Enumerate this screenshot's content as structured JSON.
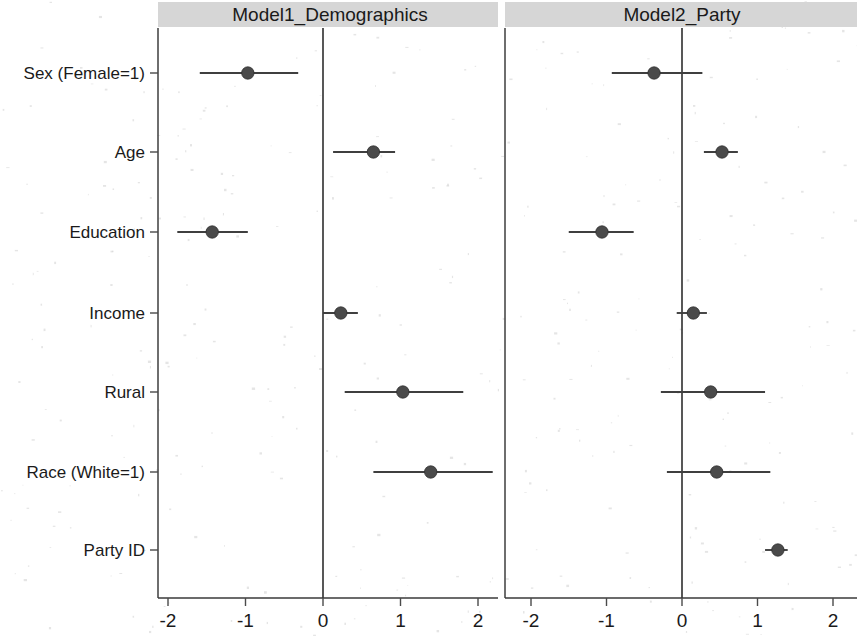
{
  "figure": {
    "type": "coefficient-plot",
    "background_color": "#ffffff",
    "strip_color": "#d6d6d6",
    "marker_color": "#4a4a4a"
  },
  "panels": [
    {
      "id": "model1",
      "title": "Model1_Demographics"
    },
    {
      "id": "model2",
      "title": "Model2_Party"
    }
  ],
  "axis": {
    "tick_labels": [
      "-2",
      "-1",
      "0",
      "1",
      "2"
    ],
    "tick_values": [
      -2,
      -1,
      0,
      1,
      2
    ],
    "xlim": [
      -2.25,
      2.4
    ],
    "reference_line": 0
  },
  "terms": [
    "Sex (Female=1)",
    "Age",
    "Education",
    "Income",
    "Rural",
    "Race (White=1)",
    "Party ID"
  ],
  "chart_data": {
    "type": "scatter",
    "title": "",
    "subtitle": "",
    "xlabel": "",
    "ylabel": "",
    "xlim": [
      -2.25,
      2.4
    ],
    "xticks": [
      -2,
      -1,
      0,
      1,
      2
    ],
    "xticklabels": [
      "-2",
      "-1",
      "0",
      "1",
      "2"
    ],
    "grid": false,
    "legend": "none",
    "reference_line_x": 0,
    "categories": [
      "Sex (Female=1)",
      "Age",
      "Education",
      "Income",
      "Rural",
      "Race (White=1)",
      "Party ID"
    ],
    "series": [
      {
        "name": "Model1_Demographics",
        "panel": "left",
        "estimates": [
          -0.97,
          0.65,
          -1.43,
          0.23,
          1.03,
          1.39,
          null
        ],
        "ci_low": [
          -1.59,
          0.13,
          -1.88,
          0.0,
          0.28,
          0.65,
          null
        ],
        "ci_high": [
          -0.32,
          0.93,
          -0.97,
          0.45,
          1.81,
          2.19,
          null
        ]
      },
      {
        "name": "Model2_Party",
        "panel": "right",
        "estimates": [
          -0.37,
          0.53,
          -1.06,
          0.15,
          0.38,
          0.46,
          1.27
        ],
        "ci_low": [
          -0.93,
          0.29,
          -1.5,
          -0.07,
          -0.28,
          -0.2,
          1.1
        ],
        "ci_high": [
          0.27,
          0.74,
          -0.64,
          0.33,
          1.1,
          1.17,
          1.4
        ]
      }
    ]
  }
}
